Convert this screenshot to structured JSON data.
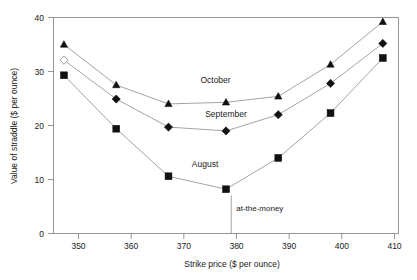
{
  "chart_data": {
    "type": "line",
    "title": "",
    "xlabel": "Strike price ($ per ounce)",
    "ylabel": "Value of straddle ($ per ounce)",
    "xlim": [
      346,
      412
    ],
    "ylim": [
      0,
      40
    ],
    "xticks": [
      350,
      360,
      370,
      380,
      390,
      400,
      410
    ],
    "yticks": [
      0,
      10,
      20,
      30,
      40
    ],
    "xtick_labels": [
      "350",
      "360",
      "370",
      "380",
      "390",
      "400",
      "410"
    ],
    "ytick_labels": [
      "0",
      "10",
      "20",
      "30",
      "40"
    ],
    "grid": false,
    "legend_position": "inline-annotations",
    "x": [
      348,
      358,
      368,
      379,
      389,
      399,
      409
    ],
    "series": [
      {
        "name": "October",
        "marker": "triangle-filled",
        "color": "#111111",
        "values": [
          35.0,
          27.5,
          24.0,
          24.3,
          25.4,
          31.3,
          39.2
        ]
      },
      {
        "name": "September",
        "marker": "diamond-filled",
        "color": "#111111",
        "first_point_marker": "diamond-open",
        "values": [
          32.1,
          24.9,
          19.7,
          19.0,
          22.0,
          27.8,
          35.2
        ]
      },
      {
        "name": "August",
        "marker": "square-filled",
        "color": "#111111",
        "values": [
          29.3,
          19.4,
          10.6,
          8.2,
          14.0,
          22.3,
          32.5
        ]
      }
    ],
    "series_labels": [
      {
        "text": "October",
        "x": 377,
        "y": 27.8
      },
      {
        "text": "September",
        "x": 379,
        "y": 21.6
      },
      {
        "text": "August",
        "x": 375,
        "y": 12.4
      }
    ],
    "annotations": [
      {
        "text": "at-the-money",
        "x": 380,
        "y_text": 4.1,
        "line_from_y": 8.2,
        "line_to_y": 0
      }
    ]
  },
  "axis": {
    "x_title": "Strike price ($ per ounce)",
    "y_title": "Value of straddle ($ per ounce)"
  }
}
